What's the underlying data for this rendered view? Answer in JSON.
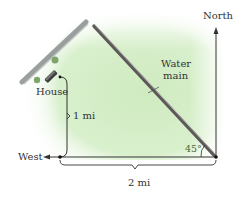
{
  "diagram": {
    "labels": {
      "north": "North",
      "west": "West",
      "house": "House",
      "water_main_line1": "Water",
      "water_main_line2": "main",
      "vertical_distance": "1 mi",
      "horizontal_distance": "2 mi",
      "angle": "45°"
    },
    "colors": {
      "ground": "#d8efcc",
      "ground_edge": "#ffffff",
      "road": "#8a8f8f",
      "water_main": "#6e6a6a",
      "lines": "#333333",
      "angle_label": "#4a6a3a"
    },
    "measurements": {
      "north_south_distance_mi": 1,
      "east_west_distance_mi": 2,
      "angle_deg": 45
    }
  }
}
